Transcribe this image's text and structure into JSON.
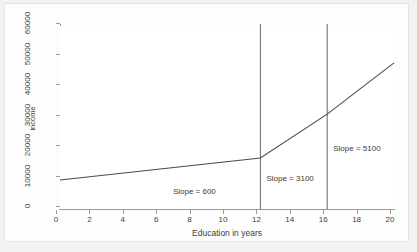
{
  "chart_data": {
    "type": "line",
    "title": "",
    "xlabel": "Education in years",
    "ylabel": "income",
    "xlim": [
      0,
      20
    ],
    "ylim": [
      0,
      60000
    ],
    "xticks": [
      0,
      2,
      4,
      6,
      8,
      10,
      12,
      14,
      16,
      18,
      20
    ],
    "xticklabels": [
      "0",
      "2",
      "4",
      "6",
      "8",
      "10",
      "12",
      "14",
      "16",
      "18",
      "20"
    ],
    "yticks": [
      0,
      10000,
      20000,
      30000,
      40000,
      50000,
      60000
    ],
    "yticklabels": [
      "0",
      "10000",
      "20000",
      "30000",
      "40000",
      "50000",
      "60000"
    ],
    "grid": false,
    "legend": null,
    "series": [
      {
        "name": "income",
        "x": [
          0,
          12,
          16,
          20
        ],
        "values": [
          9500,
          16700,
          31100,
          47900
        ]
      }
    ],
    "vlines": [
      {
        "x": 12,
        "color": "#555555"
      },
      {
        "x": 16,
        "color": "#555555"
      }
    ],
    "annotations": [
      {
        "text": "Slope = 600",
        "x": 7.0,
        "y": 4600
      },
      {
        "text": "Slope = 3100",
        "x": 12.6,
        "y": 8900
      },
      {
        "text": "Slope = 5100",
        "x": 16.6,
        "y": 18600
      }
    ],
    "colors": {
      "line": "#4a4a4a",
      "axis": "#9a9a9a",
      "text": "#3d3d3d",
      "plot_background": "#ffffff",
      "graph_background": "#fdfdfd",
      "page_background": "#f2f2f2"
    }
  }
}
